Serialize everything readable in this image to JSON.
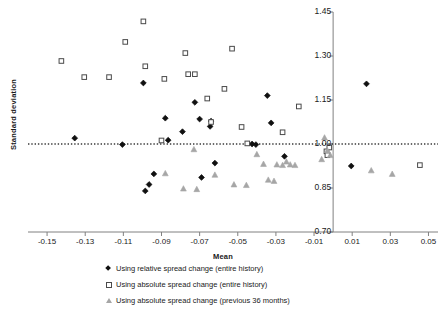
{
  "chart_data": {
    "type": "scatter",
    "title": "",
    "xlabel": "Mean",
    "ylabel": "Standard deviation",
    "xlim": [
      -0.16,
      0.055
    ],
    "ylim": [
      0.7,
      1.45
    ],
    "xticks": [
      "-0.15",
      "-0.13",
      "-0.11",
      "-0.09",
      "-0.07",
      "-0.05",
      "-0.03",
      "-0.01",
      "0.01",
      "0.03",
      "0.05"
    ],
    "xtick_values": [
      -0.15,
      -0.13,
      -0.11,
      -0.09,
      -0.07,
      -0.05,
      -0.03,
      -0.01,
      0.01,
      0.03,
      0.05
    ],
    "yticks": [
      "1.45",
      "1.30",
      "1.15",
      "1.00",
      "0.85",
      "0.70"
    ],
    "ytick_values": [
      1.45,
      1.3,
      1.15,
      1.0,
      0.85,
      0.7
    ],
    "grid": false,
    "legend_position": "bottom",
    "reference_line": {
      "orientation": "horizontal",
      "value": 1.0,
      "style": "dotted",
      "color": "#3a3a3a"
    },
    "axis_colors": {
      "x_axis": "#808080",
      "y_axis": "#808080",
      "text": "#1a1a1a"
    },
    "series": [
      {
        "name": "Using relative spread change (entire history)",
        "marker": "diamond",
        "color": "#101010",
        "points": [
          [
            -0.1355,
            1.02
          ],
          [
            -0.1105,
            0.998
          ],
          [
            -0.0995,
            1.208
          ],
          [
            -0.094,
            0.898
          ],
          [
            -0.0965,
            0.862
          ],
          [
            -0.0985,
            0.84
          ],
          [
            -0.088,
            1.088
          ],
          [
            -0.0865,
            1.013
          ],
          [
            -0.079,
            1.042
          ],
          [
            -0.0725,
            1.142
          ],
          [
            -0.07,
            1.085
          ],
          [
            -0.069,
            0.886
          ],
          [
            -0.0645,
            1.06
          ],
          [
            -0.064,
            1.078
          ],
          [
            -0.062,
            0.935
          ],
          [
            -0.0425,
            1.0
          ],
          [
            -0.0405,
            0.998
          ],
          [
            -0.0345,
            1.165
          ],
          [
            -0.0325,
            1.072
          ],
          [
            -0.0255,
            0.958
          ],
          [
            0.0095,
            0.925
          ],
          [
            0.0175,
            1.205
          ]
        ]
      },
      {
        "name": "Using absolute spread change (entire history)",
        "marker": "square",
        "color": "#4a4a4a",
        "points": [
          [
            -0.1425,
            1.283
          ],
          [
            -0.1305,
            1.228
          ],
          [
            -0.1175,
            1.228
          ],
          [
            -0.109,
            1.348
          ],
          [
            -0.0995,
            1.418
          ],
          [
            -0.0985,
            1.265
          ],
          [
            -0.09,
            1.012
          ],
          [
            -0.0885,
            1.222
          ],
          [
            -0.0775,
            1.31
          ],
          [
            -0.076,
            1.238
          ],
          [
            -0.0725,
            1.238
          ],
          [
            -0.066,
            1.155
          ],
          [
            -0.064,
            1.075
          ],
          [
            -0.057,
            1.188
          ],
          [
            -0.053,
            1.325
          ],
          [
            -0.048,
            1.058
          ],
          [
            -0.045,
            1.002
          ],
          [
            -0.0265,
            1.04
          ],
          [
            -0.018,
            1.128
          ],
          [
            -0.0035,
            0.975
          ],
          [
            -0.003,
            0.962
          ],
          [
            -0.002,
            0.988
          ],
          [
            0.0455,
            0.928
          ]
        ]
      },
      {
        "name": "Using absolute spread change (previous 36 months)",
        "marker": "triangle",
        "color": "#a6a6a6",
        "points": [
          [
            -0.088,
            0.9
          ],
          [
            -0.0785,
            0.848
          ],
          [
            -0.073,
            0.982
          ],
          [
            -0.0715,
            0.846
          ],
          [
            -0.062,
            0.895
          ],
          [
            -0.052,
            0.862
          ],
          [
            -0.0455,
            0.86
          ],
          [
            -0.04,
            0.965
          ],
          [
            -0.0365,
            0.932
          ],
          [
            -0.034,
            0.878
          ],
          [
            -0.031,
            0.874
          ],
          [
            -0.0295,
            0.93
          ],
          [
            -0.0265,
            0.928
          ],
          [
            -0.0245,
            0.94
          ],
          [
            -0.0225,
            0.93
          ],
          [
            -0.02,
            0.928
          ],
          [
            -0.006,
            0.948
          ],
          [
            -0.0045,
            1.022
          ],
          [
            -0.003,
            0.978
          ],
          [
            -0.0015,
            0.962
          ],
          [
            0.02,
            0.91
          ],
          [
            0.031,
            0.898
          ]
        ]
      }
    ]
  },
  "legend": {
    "items": [
      {
        "label": "Using relative spread change (entire history)",
        "marker": "diamond"
      },
      {
        "label": "Using absolute spread change (entire history)",
        "marker": "square"
      },
      {
        "label": "Using absolute spread change (previous 36 months)",
        "marker": "triangle"
      }
    ]
  }
}
